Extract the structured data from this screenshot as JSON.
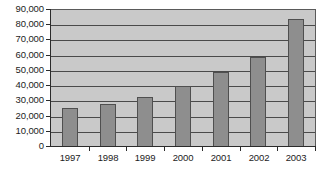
{
  "chart_data": {
    "type": "bar",
    "title": "",
    "xlabel": "",
    "ylabel": "",
    "categories": [
      "1997",
      "1998",
      "1999",
      "2000",
      "2001",
      "2002",
      "2003"
    ],
    "values": [
      25500,
      28500,
      33000,
      40000,
      49000,
      59000,
      84000
    ],
    "ylim": [
      0,
      90000
    ],
    "yticks": [
      0,
      10000,
      20000,
      30000,
      40000,
      50000,
      60000,
      70000,
      80000,
      90000
    ],
    "ytick_labels": [
      "0",
      "10,000",
      "20,000",
      "30,000",
      "40,000",
      "50,000",
      "60,000",
      "70,000",
      "80,000",
      "90,000"
    ],
    "grid": true,
    "legend": false,
    "legend_position": "none",
    "series": [
      {
        "name": "",
        "values": [
          25500,
          28500,
          33000,
          40000,
          49000,
          59000,
          84000
        ]
      }
    ],
    "colors": {
      "bar_fill": "#8e8e8e",
      "bar_border": "#4f4f4f",
      "plot_background": "#c9c9c9",
      "gridline": "#4a4a4a",
      "axis": "#2b2b2b",
      "text": "#1c1c1c",
      "figure_background": "#ffffff"
    }
  },
  "caption": {
    "text": ""
  }
}
